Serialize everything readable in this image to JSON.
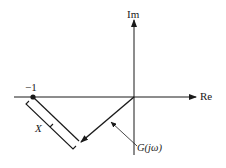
{
  "diagram": {
    "type": "nyquist-plot-sketch",
    "axes": {
      "real_label": "Re",
      "imag_label": "Im"
    },
    "critical_point": {
      "label": "−1",
      "value": -1
    },
    "curve": {
      "label": "G(jω)"
    },
    "distance": {
      "label": "X"
    },
    "colors": {
      "ink": "#1a1a1a",
      "background": "#ffffff"
    }
  }
}
